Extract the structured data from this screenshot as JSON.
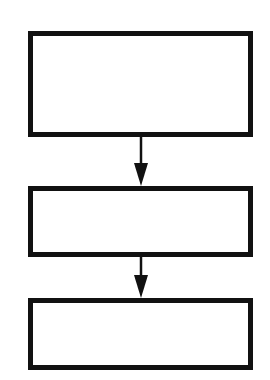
{
  "diagram": {
    "type": "flowchart",
    "direction": "top-to-bottom",
    "colors": {
      "stroke": "#111111",
      "fill": "#ffffff",
      "background": "#ffffff"
    },
    "nodes": [
      {
        "id": "box-1",
        "label": "",
        "x": 28,
        "y": 31,
        "w": 225,
        "h": 106
      },
      {
        "id": "box-2",
        "label": "",
        "x": 28,
        "y": 186,
        "w": 225,
        "h": 71
      },
      {
        "id": "box-3",
        "label": "",
        "x": 28,
        "y": 298,
        "w": 225,
        "h": 72
      }
    ],
    "edges": [
      {
        "from": "box-1",
        "to": "box-2",
        "label": ""
      },
      {
        "from": "box-2",
        "to": "box-3",
        "label": ""
      }
    ]
  }
}
